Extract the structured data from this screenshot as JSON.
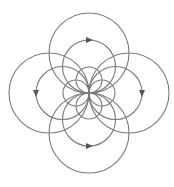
{
  "diagram": {
    "title": "",
    "type": "dipole-field-lines",
    "center": {
      "x": 89,
      "y": 93
    },
    "stroke_color": "#7a7a7a",
    "arrow_color": "#555555",
    "radii": [
      13,
      26.5,
      40
    ],
    "directions": [
      "up",
      "down",
      "left",
      "right"
    ],
    "arrows": [
      {
        "on": "up",
        "radius": 26.5,
        "pointing": "right"
      },
      {
        "on": "down",
        "radius": 26.5,
        "pointing": "right"
      },
      {
        "on": "left",
        "radius": 26.5,
        "pointing": "down"
      },
      {
        "on": "right",
        "radius": 26.5,
        "pointing": "down"
      }
    ]
  }
}
